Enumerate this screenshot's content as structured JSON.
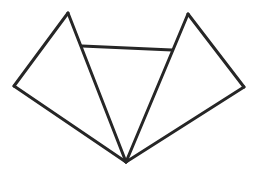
{
  "diagram": {
    "title": "",
    "width": 257,
    "height": 179,
    "background": "#ffffff",
    "stroke_color": "#262626",
    "stroke_width": 3,
    "points": {
      "A": [
        68,
        13
      ],
      "B": [
        188,
        14
      ],
      "C": [
        14,
        86
      ],
      "D": [
        244,
        87
      ],
      "E": [
        126,
        162
      ],
      "F": [
        82,
        46
      ],
      "G": [
        172,
        50
      ]
    },
    "edges": [
      [
        "C",
        "A"
      ],
      [
        "A",
        "E"
      ],
      [
        "E",
        "C"
      ],
      [
        "B",
        "D"
      ],
      [
        "D",
        "E"
      ],
      [
        "E",
        "B"
      ],
      [
        "F",
        "G"
      ]
    ]
  }
}
